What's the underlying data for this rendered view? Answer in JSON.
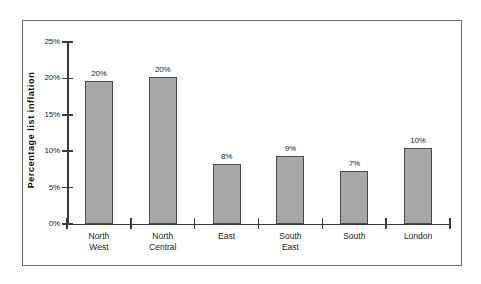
{
  "chart_data": {
    "type": "bar",
    "title": "",
    "subtitle": "",
    "xlabel": "",
    "ylabel": "Percentage  list  inflation",
    "categories": [
      "North West",
      "North Central",
      "East",
      "South East",
      "South",
      "London"
    ],
    "values": [
      20,
      20,
      8,
      9,
      7,
      10
    ],
    "value_labels": [
      "20%",
      "20%",
      "8%",
      "9%",
      "7%",
      "10%"
    ],
    "bar_heights_measured": [
      19.7,
      20.2,
      8.2,
      9.3,
      7.3,
      10.4
    ],
    "ylim": [
      0,
      25
    ],
    "ytick_values": [
      0,
      5,
      10,
      15,
      20,
      25
    ],
    "ytick_labels": [
      "0%",
      "5%",
      "10%",
      "15%",
      "20%",
      "25%"
    ],
    "grid": false,
    "legend": null,
    "bar_color": "#a8a8a8",
    "bar_border_color": "#4a4a4a",
    "axis_color": "#3a3a3a",
    "frame_color": "#6f6f6f",
    "background_color": "#ffffff"
  },
  "categories_display": [
    "North\nWest",
    "North\nCentral",
    "East",
    "South\nEast",
    "South",
    "London"
  ]
}
